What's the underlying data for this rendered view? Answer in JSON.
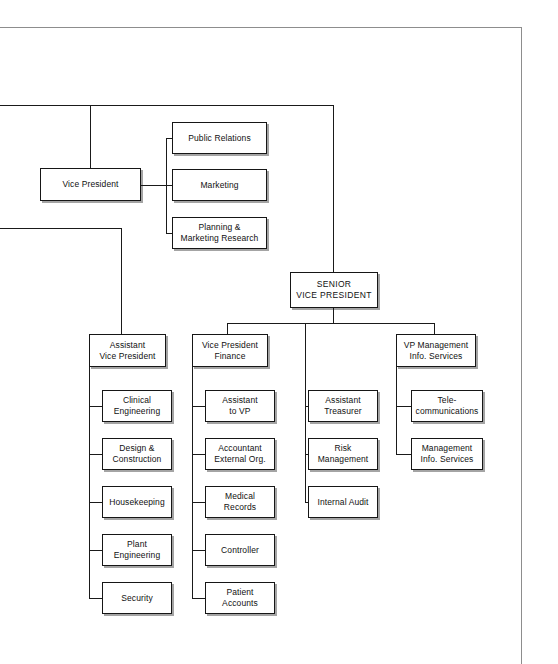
{
  "chart": {
    "type": "org-chart",
    "background_color": "#ffffff",
    "line_color": "#161616",
    "box_fill": "#ffffff",
    "nodes": {
      "vice_president": "Vice President",
      "public_relations": "Public Relations",
      "marketing": "Marketing",
      "planning_marketing_research": "Planning &\nMarketing Research",
      "senior_vice_president": "SENIOR\nVICE PRESIDENT",
      "assistant_vice_president": "Assistant\nVice President",
      "clinical_engineering": "Clinical\nEngineering",
      "design_construction": "Design &\nConstruction",
      "housekeeping": "Housekeeping",
      "plant_engineering": "Plant Engineering",
      "security": "Security",
      "vice_president_finance": "Vice President\nFinance",
      "assistant_to_vp": "Assistant\nto VP",
      "accountant_external_org": "Accountant\nExternal Org.",
      "medical_records": "Medical Records",
      "controller": "Controller",
      "patient_accounts": "Patient Accounts",
      "assistant_treasurer": "Assistant\nTreasurer",
      "risk_management": "Risk Management",
      "internal_audit": "Internal Audit",
      "vp_management_info_services": "VP Management\nInfo. Services",
      "telecommunications": "Tele-\ncommunications",
      "management_info_services": "Management\nInfo. Services"
    },
    "hierarchy": {
      "vice_president": [
        "public_relations",
        "marketing",
        "planning_marketing_research"
      ],
      "senior_vice_president": [
        "vice_president_finance",
        "assistant_treasurer_group",
        "vp_management_info_services"
      ],
      "assistant_vice_president": [
        "clinical_engineering",
        "design_construction",
        "housekeeping",
        "plant_engineering",
        "security"
      ],
      "vice_president_finance": [
        "assistant_to_vp",
        "accountant_external_org",
        "medical_records",
        "controller",
        "patient_accounts"
      ],
      "assistant_treasurer_group": [
        "assistant_treasurer",
        "risk_management",
        "internal_audit"
      ],
      "vp_management_info_services": [
        "telecommunications",
        "management_info_services"
      ]
    }
  }
}
